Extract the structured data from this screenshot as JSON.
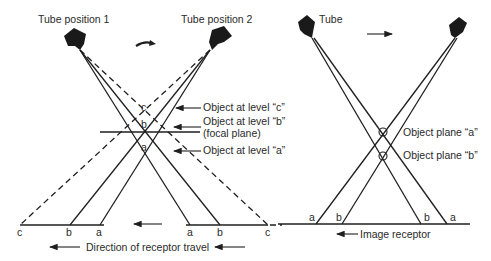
{
  "left_diagram": {
    "tube1_label": "Tube position 1",
    "tube2_label": "Tube position 2",
    "object_c_label": "Object at level “c”",
    "object_b_label": "Object at level “b”",
    "object_b_sub": "(focal plane)",
    "object_a_label": "Object at level “a”",
    "crossing_labels": {
      "c": "c",
      "b": "b",
      "a": "a"
    },
    "receptor_left_labels": [
      "c",
      "b",
      "a"
    ],
    "receptor_right_labels": [
      "a",
      "b",
      "c"
    ],
    "caption": "Direction of receptor travel",
    "icons": [
      "x-ray-tube-icon",
      "x-ray-tube-icon",
      "curved-arrow-icon",
      "arrow-left-icon"
    ]
  },
  "right_diagram": {
    "tube_label": "Tube",
    "plane_a_label": "Object plane “a”",
    "plane_b_label": "Object plane “b”",
    "receptor_left_labels": [
      "a",
      "b"
    ],
    "receptor_right_labels": [
      "b",
      "a"
    ],
    "caption": "Image receptor",
    "icons": [
      "x-ray-tube-icon",
      "x-ray-tube-icon",
      "arrow-right-icon",
      "arrow-left-icon",
      "circled-x-icon"
    ]
  },
  "colors": {
    "line": "#1f1f1f",
    "text": "#2a2a2a",
    "background": "#ffffff"
  }
}
